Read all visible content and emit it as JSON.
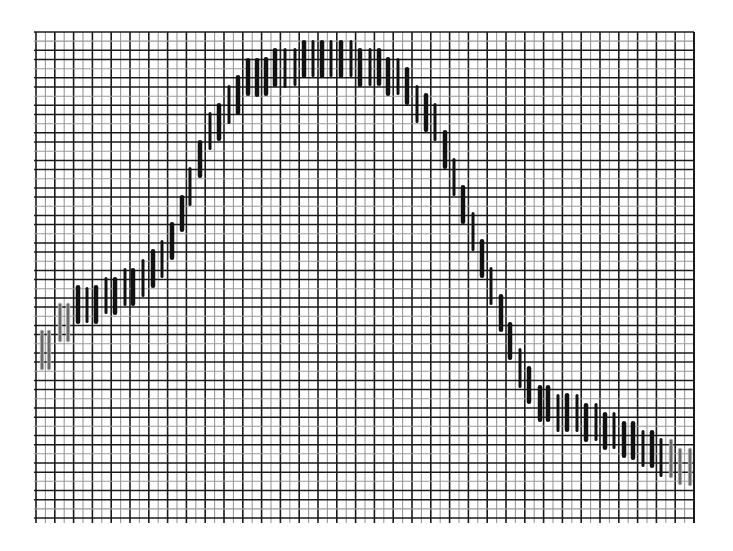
{
  "chart_data": {
    "type": "bar",
    "subtype": "floating-range-bars-on-grid",
    "title": "",
    "xlabel": "",
    "ylabel": "",
    "grid": true,
    "legend": null,
    "plot_area_px": {
      "left": 36,
      "top": 32,
      "right": 694,
      "bottom": 518
    },
    "grid_spacing_px": {
      "x": 9.4,
      "y": 9.2
    },
    "colors": {
      "background": "#ffffff",
      "grid_minor": "#9a9a9a",
      "grid_major": "#1a1a1a",
      "bar": "#111111",
      "bar_faint": "#6a6a6a"
    },
    "note": "Values are bar top/bottom in pixel rows (y grows downward). Bars trace a rising-then-falling wave.",
    "bars": [
      {
        "x": 42,
        "top": 330,
        "bottom": 370,
        "style": "faint"
      },
      {
        "x": 49,
        "top": 330,
        "bottom": 370,
        "style": "faint"
      },
      {
        "x": 60,
        "top": 303,
        "bottom": 342,
        "style": "faint"
      },
      {
        "x": 68,
        "top": 303,
        "bottom": 342,
        "style": "faint"
      },
      {
        "x": 78,
        "top": 285,
        "bottom": 324,
        "style": "bold"
      },
      {
        "x": 87,
        "top": 287,
        "bottom": 323,
        "style": "thin"
      },
      {
        "x": 96,
        "top": 285,
        "bottom": 324,
        "style": "bold"
      },
      {
        "x": 106,
        "top": 277,
        "bottom": 314,
        "style": "thin"
      },
      {
        "x": 115,
        "top": 277,
        "bottom": 315,
        "style": "bold"
      },
      {
        "x": 125,
        "top": 268,
        "bottom": 306,
        "style": "thin"
      },
      {
        "x": 133,
        "top": 268,
        "bottom": 306,
        "style": "bold"
      },
      {
        "x": 143,
        "top": 259,
        "bottom": 297,
        "style": "thin"
      },
      {
        "x": 153,
        "top": 249,
        "bottom": 288,
        "style": "bold"
      },
      {
        "x": 162,
        "top": 240,
        "bottom": 278,
        "style": "thin"
      },
      {
        "x": 172,
        "top": 222,
        "bottom": 260,
        "style": "bold"
      },
      {
        "x": 182,
        "top": 195,
        "bottom": 232,
        "style": "bold"
      },
      {
        "x": 190,
        "top": 167,
        "bottom": 206,
        "style": "thin"
      },
      {
        "x": 200,
        "top": 140,
        "bottom": 178,
        "style": "bold"
      },
      {
        "x": 210,
        "top": 112,
        "bottom": 150,
        "style": "thin"
      },
      {
        "x": 219,
        "top": 103,
        "bottom": 141,
        "style": "bold"
      },
      {
        "x": 229,
        "top": 85,
        "bottom": 124,
        "style": "thin"
      },
      {
        "x": 238,
        "top": 75,
        "bottom": 115,
        "style": "bold"
      },
      {
        "x": 248,
        "top": 58,
        "bottom": 96,
        "style": "bold"
      },
      {
        "x": 257,
        "top": 58,
        "bottom": 97,
        "style": "bold"
      },
      {
        "x": 266,
        "top": 57,
        "bottom": 96,
        "style": "bold"
      },
      {
        "x": 275,
        "top": 48,
        "bottom": 87,
        "style": "bold"
      },
      {
        "x": 285,
        "top": 48,
        "bottom": 88,
        "style": "thin"
      },
      {
        "x": 295,
        "top": 48,
        "bottom": 86,
        "style": "thin"
      },
      {
        "x": 304,
        "top": 40,
        "bottom": 78,
        "style": "bold"
      },
      {
        "x": 313,
        "top": 40,
        "bottom": 77,
        "style": "thin"
      },
      {
        "x": 322,
        "top": 40,
        "bottom": 78,
        "style": "bold"
      },
      {
        "x": 331,
        "top": 40,
        "bottom": 77,
        "style": "thin"
      },
      {
        "x": 341,
        "top": 40,
        "bottom": 78,
        "style": "bold"
      },
      {
        "x": 351,
        "top": 40,
        "bottom": 77,
        "style": "thin"
      },
      {
        "x": 360,
        "top": 48,
        "bottom": 87,
        "style": "bold"
      },
      {
        "x": 370,
        "top": 48,
        "bottom": 86,
        "style": "thin"
      },
      {
        "x": 379,
        "top": 48,
        "bottom": 86,
        "style": "bold"
      },
      {
        "x": 388,
        "top": 57,
        "bottom": 96,
        "style": "bold"
      },
      {
        "x": 398,
        "top": 58,
        "bottom": 95,
        "style": "thin"
      },
      {
        "x": 407,
        "top": 67,
        "bottom": 105,
        "style": "bold"
      },
      {
        "x": 417,
        "top": 85,
        "bottom": 123,
        "style": "thin"
      },
      {
        "x": 426,
        "top": 93,
        "bottom": 132,
        "style": "bold"
      },
      {
        "x": 435,
        "top": 103,
        "bottom": 141,
        "style": "thin"
      },
      {
        "x": 445,
        "top": 130,
        "bottom": 169,
        "style": "bold"
      },
      {
        "x": 454,
        "top": 158,
        "bottom": 196,
        "style": "thin"
      },
      {
        "x": 463,
        "top": 185,
        "bottom": 224,
        "style": "bold"
      },
      {
        "x": 473,
        "top": 212,
        "bottom": 251,
        "style": "thin"
      },
      {
        "x": 482,
        "top": 239,
        "bottom": 278,
        "style": "bold"
      },
      {
        "x": 491,
        "top": 267,
        "bottom": 305,
        "style": "thin"
      },
      {
        "x": 501,
        "top": 294,
        "bottom": 332,
        "style": "bold"
      },
      {
        "x": 510,
        "top": 322,
        "bottom": 360,
        "style": "bold"
      },
      {
        "x": 520,
        "top": 348,
        "bottom": 388,
        "style": "thin"
      },
      {
        "x": 529,
        "top": 366,
        "bottom": 404,
        "style": "bold"
      },
      {
        "x": 540,
        "top": 385,
        "bottom": 422,
        "style": "bold"
      },
      {
        "x": 548,
        "top": 385,
        "bottom": 422,
        "style": "bold"
      },
      {
        "x": 558,
        "top": 394,
        "bottom": 432,
        "style": "thin"
      },
      {
        "x": 567,
        "top": 393,
        "bottom": 432,
        "style": "bold"
      },
      {
        "x": 577,
        "top": 394,
        "bottom": 432,
        "style": "thin"
      },
      {
        "x": 586,
        "top": 403,
        "bottom": 442,
        "style": "bold"
      },
      {
        "x": 596,
        "top": 403,
        "bottom": 441,
        "style": "thin"
      },
      {
        "x": 605,
        "top": 412,
        "bottom": 450,
        "style": "bold"
      },
      {
        "x": 614,
        "top": 412,
        "bottom": 449,
        "style": "thin"
      },
      {
        "x": 624,
        "top": 421,
        "bottom": 458,
        "style": "bold"
      },
      {
        "x": 633,
        "top": 421,
        "bottom": 460,
        "style": "bold"
      },
      {
        "x": 643,
        "top": 430,
        "bottom": 467,
        "style": "thin"
      },
      {
        "x": 652,
        "top": 430,
        "bottom": 468,
        "style": "bold"
      },
      {
        "x": 661,
        "top": 438,
        "bottom": 477,
        "style": "thin"
      },
      {
        "x": 671,
        "top": 439,
        "bottom": 478,
        "style": "faint"
      },
      {
        "x": 680,
        "top": 448,
        "bottom": 485,
        "style": "faint"
      },
      {
        "x": 690,
        "top": 448,
        "bottom": 486,
        "style": "faint"
      }
    ]
  }
}
